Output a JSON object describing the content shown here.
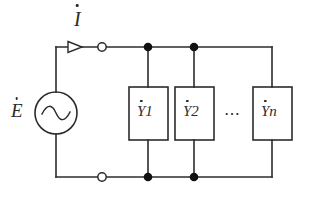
{
  "diagram": {
    "stroke_color": "#2b2b2b",
    "background_color": "#ffffff",
    "labels": {
      "current": {
        "symbol": "I",
        "subscript": "",
        "has_dot": true
      },
      "emf": {
        "symbol": "E",
        "subscript": "",
        "has_dot": true
      },
      "ellipsis": "⋯"
    },
    "source": {
      "type": "ac-voltage-source",
      "waveform": "sine",
      "label": "E"
    },
    "branches": [
      {
        "name": "admittance-1",
        "symbol": "Y",
        "subscript": "1",
        "has_dot": true
      },
      {
        "name": "admittance-2",
        "symbol": "Y",
        "subscript": "2",
        "has_dot": true
      },
      {
        "name": "admittance-n",
        "symbol": "Y",
        "subscript": "n",
        "has_dot": true
      }
    ],
    "nodes": {
      "top_rail_y": 47,
      "bottom_rail_y": 177,
      "filled_node_x": [
        148,
        194
      ],
      "open_terminal_x": [
        102
      ]
    }
  }
}
